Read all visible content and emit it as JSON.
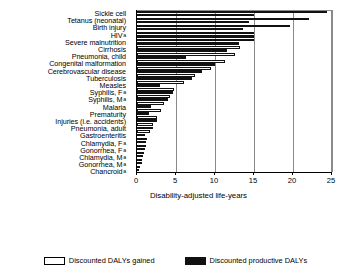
{
  "chart_data": {
    "type": "bar",
    "orientation": "horizontal",
    "title": "",
    "xlabel": "Disability-adjusted life-years",
    "ylabel": "",
    "xlim": [
      0,
      25
    ],
    "xticks": [
      0,
      5,
      10,
      15,
      20,
      25
    ],
    "grid": true,
    "legend_position": "bottom",
    "categories": [
      "Sickle cell",
      "Tetanus (neonatal)",
      "Birth injury",
      "HIV",
      "Severe malnutrition",
      "Cirrhosis",
      "Pneumonia, child",
      "Congenital malformation",
      "Cerebrovascular disease",
      "Tuberculosis",
      "Measles",
      "Syphilis, F",
      "Syphilis, M",
      "Malaria",
      "Prematurity",
      "Injuries (i.e. accidents)",
      "Pneumonia, adult",
      "Gastroenteritis",
      "Chlamydia, F",
      "Gonorrhea, F",
      "Chlamydia, M",
      "Gonorrhea, M",
      "Chancroid"
    ],
    "category_footnotes": [
      "",
      "",
      "",
      "a",
      "",
      "",
      "",
      "",
      "",
      "",
      "",
      "a",
      "a",
      "",
      "",
      "",
      "",
      "",
      "a",
      "a",
      "a",
      "a",
      "a"
    ],
    "series": [
      {
        "name": "Discounted DALYs gained",
        "style": "open",
        "values": [
          24.4,
          22.0,
          19.6,
          15.0,
          15.0,
          13.2,
          12.6,
          11.3,
          9.5,
          7.4,
          6.0,
          4.8,
          4.2,
          3.5,
          3.1,
          2.6,
          2.1,
          1.7,
          1.3,
          1.1,
          0.9,
          0.7,
          0.35
        ]
      },
      {
        "name": "Discounted productive DALYs",
        "style": "solid",
        "values": [
          15.0,
          14.3,
          13.6,
          15.0,
          13.1,
          11.5,
          6.3,
          10.0,
          8.3,
          7.0,
          3.0,
          4.6,
          4.0,
          1.8,
          1.5,
          2.5,
          2.0,
          1.0,
          1.2,
          1.0,
          0.8,
          0.6,
          0.3
        ]
      }
    ]
  },
  "axis": {
    "tick_labels": [
      "0",
      "5",
      "10",
      "15",
      "20",
      "25"
    ],
    "x_axis_title": "Disability-adjusted life-years"
  },
  "legend": {
    "items": [
      {
        "label": "Discounted DALYs gained",
        "style": "open"
      },
      {
        "label": "Discounted productive DALYs",
        "style": "solid"
      }
    ]
  }
}
